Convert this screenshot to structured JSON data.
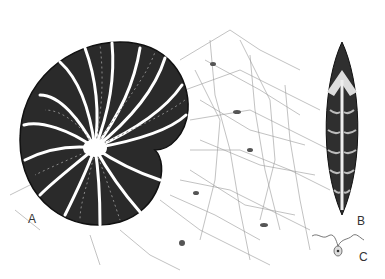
{
  "figure": {
    "labels": {
      "a": "A",
      "b": "B",
      "c": "C"
    },
    "panels": [
      {
        "id": "A",
        "subject": "coiled chambered shell with radiating reticulopodial network"
      },
      {
        "id": "B",
        "subject": "elongate spindle-shaped ribbed test"
      },
      {
        "id": "C",
        "subject": "small biflagellate cell"
      }
    ],
    "colors": {
      "ink": "#222222",
      "paper": "#ffffff",
      "stipple": "#888888"
    }
  }
}
